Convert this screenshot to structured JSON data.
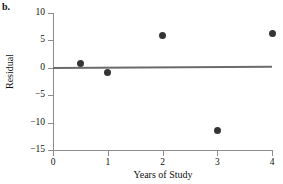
{
  "panel": {
    "label": "b."
  },
  "chart_data": {
    "type": "scatter",
    "title": "",
    "subtitle": "",
    "xlabel": "Years of Study",
    "ylabel": "Residual",
    "xlim": [
      0,
      4
    ],
    "ylim": [
      -15,
      10
    ],
    "xticks": [
      0,
      1,
      2,
      3,
      4
    ],
    "xtick_labels": [
      "0",
      "1",
      "2",
      "3",
      "4"
    ],
    "yticks": [
      10,
      5,
      0,
      -5,
      -10,
      -15
    ],
    "ytick_labels": [
      "10",
      "5",
      "0",
      "−5",
      "−10",
      "−15"
    ],
    "grid": false,
    "legend": null,
    "points": [
      {
        "x": 0.5,
        "y": 0.8
      },
      {
        "x": 1.0,
        "y": -0.9
      },
      {
        "x": 2.0,
        "y": 5.9
      },
      {
        "x": 3.0,
        "y": -11.4
      },
      {
        "x": 4.0,
        "y": 6.2
      }
    ],
    "reference_line": {
      "name": "zero-residual-fit-line",
      "x0": 0.0,
      "y0": 0.1,
      "x1": 4.0,
      "y1": 0.35
    },
    "colors": {
      "marker": "#353535",
      "line": "#6b6b6b",
      "axis": "#8d8d8d",
      "text": "#111111",
      "background": "#ffffff"
    }
  }
}
